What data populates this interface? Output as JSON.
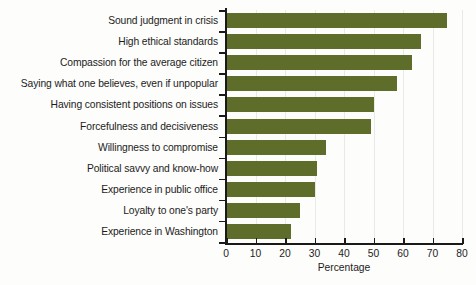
{
  "chart_data": {
    "type": "bar",
    "orientation": "horizontal",
    "title": "",
    "xlabel": "Percentage",
    "ylabel": "",
    "xlim": [
      0,
      80
    ],
    "xticks": [
      0,
      10,
      20,
      30,
      40,
      50,
      60,
      70,
      80
    ],
    "grid": true,
    "legend": null,
    "bar_color": "#5f6d2a",
    "categories": [
      "Sound judgment in crisis",
      "High ethical standards",
      "Compassion for the average citizen",
      "Saying what one believes, even if unpopular",
      "Having consistent positions on issues",
      "Forcefulness and decisiveness",
      "Willingness to compromise",
      "Political savvy and know-how",
      "Experience in public office",
      "Loyalty to one's party",
      "Experience in Washington"
    ],
    "values": [
      75,
      66,
      63,
      58,
      50,
      49,
      34,
      31,
      30,
      25,
      22
    ]
  }
}
